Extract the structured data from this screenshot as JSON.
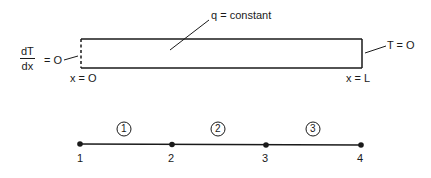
{
  "diagram": {
    "domain_bar": {
      "source_label": "q = constant",
      "left_bc": {
        "numerator": "dT",
        "denominator": "dx",
        "rhs": "= O"
      },
      "right_bc": "T = O",
      "left_position": "x = O",
      "right_position": "x = L"
    },
    "mesh": {
      "nodes": [
        "1",
        "2",
        "3",
        "4"
      ],
      "elements": [
        "1",
        "2",
        "3"
      ]
    },
    "colors": {
      "line": "#1a1a1a",
      "background": "#ffffff"
    }
  }
}
